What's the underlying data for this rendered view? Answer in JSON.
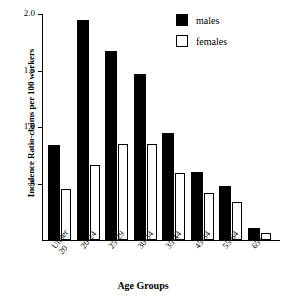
{
  "chart_data": {
    "type": "bar",
    "title": "",
    "xlabel": "Age Groups",
    "ylabel": "Incidence Ratio-claims per 100 workers",
    "categories": [
      "Under\n20",
      "20-24",
      "25-29",
      "30-34",
      "35-44",
      "45-54",
      "55-64",
      "65+"
    ],
    "ylim": [
      0,
      2.0
    ],
    "yticks": [
      "2.0",
      "1.5",
      "1.0",
      ".5"
    ],
    "ytick_values": [
      2.0,
      1.5,
      1.0,
      0.5
    ],
    "grid": false,
    "legend_position": "top-right",
    "series": [
      {
        "name": "males",
        "color": "#000000",
        "values": [
          0.84,
          1.95,
          1.67,
          1.47,
          0.95,
          0.6,
          0.48,
          0.11
        ]
      },
      {
        "name": "females",
        "color": "#ffffff",
        "values": [
          0.45,
          0.66,
          0.85,
          0.85,
          0.59,
          0.42,
          0.34,
          0.06
        ]
      }
    ]
  },
  "legend": {
    "items": [
      {
        "label": "males",
        "swatch": "filled-black-square"
      },
      {
        "label": "females",
        "swatch": "outlined-white-square"
      }
    ]
  }
}
